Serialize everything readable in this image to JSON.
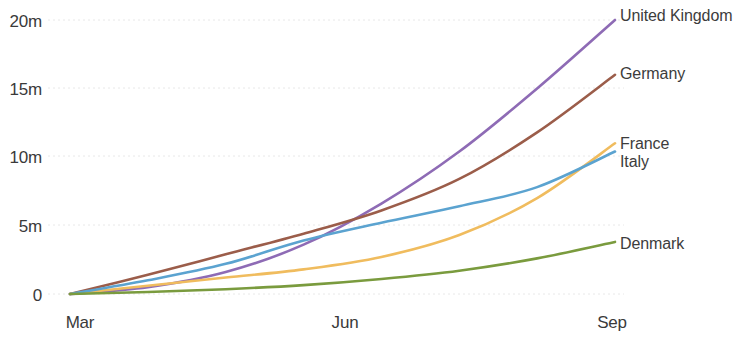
{
  "chart_data": {
    "type": "line",
    "title": "",
    "subtitle": "",
    "xlabel": "",
    "ylabel": "",
    "grid": true,
    "legend_position": "right-inline-end-of-line",
    "x_tick_labels": [
      "Mar",
      "Jun",
      "Sep"
    ],
    "y_tick_labels": [
      "0",
      "5m",
      "10m",
      "15m",
      "20m"
    ],
    "y_tick_values": [
      0,
      5000000,
      10000000,
      15000000,
      20000000
    ],
    "ylim": [
      0,
      21500000
    ],
    "xlim": [
      "Mar",
      "Oct"
    ],
    "x": [
      "Mar",
      "Apr",
      "May",
      "Jun",
      "Jul",
      "Aug",
      "Sep",
      "Oct"
    ],
    "series": [
      {
        "name": "United Kingdom",
        "color": "#8e6bb5",
        "values": [
          0,
          0.5,
          1.6,
          3.6,
          6.6,
          10.4,
          15.0,
          20.0
        ],
        "unit": "m",
        "end_value_label": "20m"
      },
      {
        "name": "Germany",
        "color": "#9b5d4a",
        "values": [
          0,
          1.4,
          2.9,
          4.4,
          6.1,
          8.4,
          11.8,
          16.0
        ],
        "unit": "m",
        "end_value_label": "16m"
      },
      {
        "name": "France",
        "color": "#f0bc5e",
        "values": [
          0,
          0.6,
          1.2,
          1.8,
          2.7,
          4.3,
          7.0,
          11.0
        ],
        "unit": "m",
        "end_value_label": "11m"
      },
      {
        "name": "Italy",
        "color": "#5ba3d0",
        "values": [
          0,
          1.0,
          2.2,
          3.9,
          5.2,
          6.4,
          7.8,
          10.4
        ],
        "unit": "m",
        "end_value_label": "10.4m"
      },
      {
        "name": "Denmark",
        "color": "#7a9b3e",
        "values": [
          0,
          0.15,
          0.35,
          0.65,
          1.1,
          1.7,
          2.6,
          3.8
        ],
        "unit": "m",
        "end_value_label": "3.8m"
      }
    ]
  },
  "axes": {
    "y_ticks": [
      {
        "label": "20m"
      },
      {
        "label": "15m"
      },
      {
        "label": "10m"
      },
      {
        "label": "5m"
      },
      {
        "label": "0"
      }
    ],
    "x_ticks": [
      {
        "label": "Mar"
      },
      {
        "label": "Jun"
      },
      {
        "label": "Sep"
      }
    ]
  },
  "legend": {
    "entries": [
      {
        "label": "United Kingdom",
        "color": "#8e6bb5"
      },
      {
        "label": "Germany",
        "color": "#9b5d4a"
      },
      {
        "label": "France",
        "color": "#f0bc5e"
      },
      {
        "label": "Italy",
        "color": "#5ba3d0"
      },
      {
        "label": "Denmark",
        "color": "#7a9b3e"
      }
    ]
  },
  "style": {
    "background": "#ffffff",
    "gridline_color": "#d8d8d8",
    "text_color": "#3a3a3a"
  }
}
